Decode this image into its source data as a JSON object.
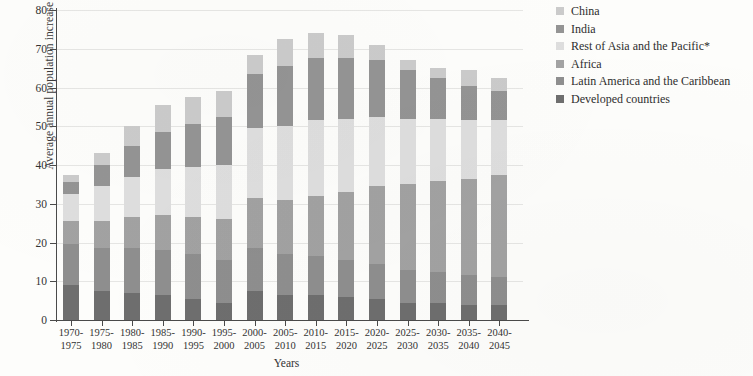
{
  "chart_data": {
    "type": "bar",
    "stacked": true,
    "title": "",
    "xlabel": "Years",
    "ylabel": "Average annual population increase (millions)",
    "ylim": [
      0,
      80
    ],
    "yticks": [
      0,
      10,
      20,
      30,
      40,
      50,
      60,
      70,
      80
    ],
    "grid": true,
    "legend_position": "right",
    "categories": [
      "1970-1975",
      "1975-1980",
      "1980-1985",
      "1985-1990",
      "1990-1995",
      "1995-2000",
      "2000-2005",
      "2005-2010",
      "2010-2015",
      "2015-2020",
      "2020-2025",
      "2025-2030",
      "2030-2035",
      "2035-2040",
      "2040-2045"
    ],
    "categories_lines": [
      [
        "1970-",
        "1975"
      ],
      [
        "1975-",
        "1980"
      ],
      [
        "1980-",
        "1985"
      ],
      [
        "1985-",
        "1990"
      ],
      [
        "1990-",
        "1995"
      ],
      [
        "1995-",
        "2000"
      ],
      [
        "2000-",
        "2005"
      ],
      [
        "2005-",
        "2010"
      ],
      [
        "2010-",
        "2015"
      ],
      [
        "2015-",
        "2020"
      ],
      [
        "2020-",
        "2025"
      ],
      [
        "2025-",
        "2030"
      ],
      [
        "2030-",
        "2035"
      ],
      [
        "2035-",
        "2040"
      ],
      [
        "2040-",
        "2045"
      ]
    ],
    "series": [
      {
        "name": "Developed countries",
        "color": "#6e6e6e",
        "values": [
          9.0,
          7.5,
          7.0,
          6.5,
          5.5,
          4.5,
          7.5,
          6.5,
          6.5,
          6.0,
          5.5,
          4.5,
          4.5,
          4.0,
          4.0
        ]
      },
      {
        "name": "Latin America and the Caribbean",
        "color": "#8e8e8e",
        "values": [
          10.5,
          11.0,
          11.5,
          11.5,
          11.5,
          11.0,
          11.0,
          10.5,
          10.0,
          9.5,
          9.0,
          8.5,
          8.0,
          7.5,
          7.0
        ]
      },
      {
        "name": "Africa",
        "color": "#a2a2a2",
        "values": [
          6.0,
          7.0,
          8.0,
          9.0,
          9.5,
          10.5,
          13.0,
          14.0,
          15.5,
          17.5,
          20.0,
          22.0,
          23.5,
          25.0,
          26.5
        ]
      },
      {
        "name": "Rest of Asia and the Pacific*",
        "color": "#dedede",
        "values": [
          7.0,
          9.0,
          10.5,
          12.0,
          13.0,
          14.0,
          18.0,
          19.0,
          19.5,
          19.0,
          18.0,
          17.0,
          16.0,
          15.0,
          14.0
        ]
      },
      {
        "name": "India",
        "color": "#949494",
        "values": [
          3.0,
          5.5,
          8.0,
          9.5,
          11.0,
          12.5,
          14.0,
          15.5,
          16.0,
          15.5,
          14.5,
          12.5,
          10.5,
          9.0,
          7.5
        ]
      },
      {
        "name": "China",
        "color": "#cbcbcb",
        "values": [
          2.0,
          3.0,
          5.0,
          7.0,
          7.0,
          6.5,
          5.0,
          7.0,
          6.5,
          6.0,
          4.0,
          2.5,
          2.5,
          4.0,
          3.5
        ]
      }
    ],
    "totals": [
      37.5,
      43.0,
      50.0,
      55.5,
      57.5,
      59.0,
      68.5,
      72.5,
      74.0,
      73.5,
      71.0,
      67.0,
      65.0,
      64.5,
      62.5
    ]
  },
  "legend": {
    "items": [
      {
        "label": "China",
        "color": "#cbcbcb"
      },
      {
        "label": "India",
        "color": "#949494"
      },
      {
        "label": "Rest of Asia and the Pacific*",
        "color": "#dedede"
      },
      {
        "label": "Africa",
        "color": "#a2a2a2"
      },
      {
        "label": "Latin America and the Caribbean",
        "color": "#8e8e8e"
      },
      {
        "label": "Developed countries",
        "color": "#6e6e6e"
      }
    ]
  }
}
